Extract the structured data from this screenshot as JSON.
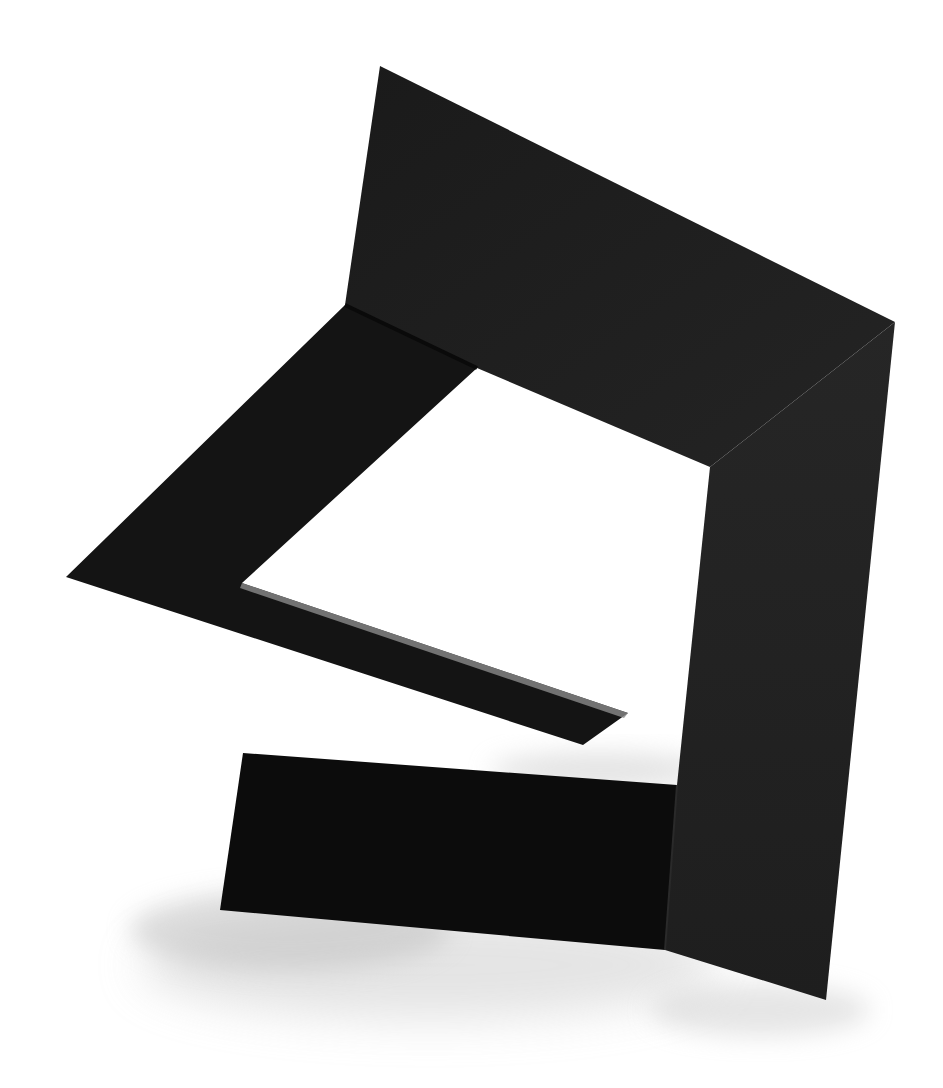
{
  "image": {
    "subject": "Black folded sheet-metal abstract sculpture on white background",
    "background_color": "#ffffff",
    "colors": {
      "panel_main": "#1c1c1c",
      "panel_right": "#202020",
      "left_flap": "#141414",
      "bottom_flap": "#0c0c0c",
      "strip": "#1a1a1a",
      "strip_bevel": "#8a8a8a",
      "shadow": "#bdbdbd"
    },
    "shapes": {
      "upper_panel": "380,66 895,322 710,467 477,368 345,305",
      "right_panel": "895,322 826,1000 665,950 677,785 710,467",
      "left_flap": "345,305 477,368 242,583 628,713 583,745 66,577",
      "bottom_flap": "243,753 677,785 665,950 220,910",
      "strip_bevel": "242,583 628,713 624,718 240,588"
    }
  }
}
